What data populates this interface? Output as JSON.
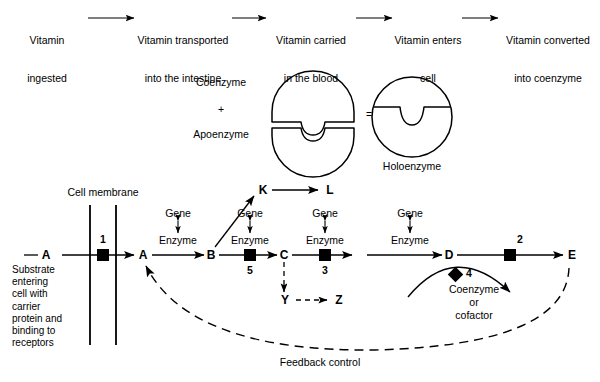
{
  "figure": {
    "background": "#ffffff",
    "ink": "#000000"
  },
  "top_flow": {
    "steps": [
      {
        "line1": "Vitamin",
        "line2": "ingested"
      },
      {
        "line1": "Vitamin transported",
        "line2": "into the intestine"
      },
      {
        "line1": "Vitamin carried",
        "line2": "in the blood"
      },
      {
        "line1": "Vitamin enters",
        "line2": "cell"
      },
      {
        "line1": "Vitamin converted",
        "line2": "into coenzyme"
      }
    ],
    "connector": "arrow-right"
  },
  "enzyme_equation": {
    "left_terms": [
      "Coenzyme",
      "+",
      "Apoenzyme"
    ],
    "operator": "=",
    "result_label": "Holoenzyme",
    "shapes": {
      "coenzyme": "upper-half-disc-with-notch",
      "apoenzyme": "lower-half-disc-with-notch",
      "holoenzyme": "full-disc-with-notch"
    }
  },
  "pathway": {
    "membrane_label": "Cell membrane",
    "substrate_caption": "Substrate\nentering\ncell with\ncarrier\nprotein and\nbinding to\nreceptors",
    "nodes": [
      {
        "id": "A_out",
        "label": "A"
      },
      {
        "id": "A_in",
        "label": "A"
      },
      {
        "id": "B",
        "label": "B"
      },
      {
        "id": "C",
        "label": "C"
      },
      {
        "id": "D",
        "label": "D"
      },
      {
        "id": "E",
        "label": "E"
      }
    ],
    "branch_nodes": [
      {
        "id": "K",
        "label": "K"
      },
      {
        "id": "L",
        "label": "L"
      },
      {
        "id": "Y",
        "label": "Y"
      },
      {
        "id": "Z",
        "label": "Z"
      }
    ],
    "gene_enzyme_pairs": [
      {
        "gene": "Gene",
        "enzyme": "Enzyme"
      },
      {
        "gene": "Gene",
        "enzyme": "Enzyme"
      },
      {
        "gene": "Gene",
        "enzyme": "Enzyme"
      },
      {
        "gene": "Gene",
        "enzyme": "Enzyme"
      }
    ],
    "block_markers": [
      {
        "number": "1",
        "shape": "square"
      },
      {
        "number": "5",
        "shape": "square"
      },
      {
        "number": "3",
        "shape": "square"
      },
      {
        "number": "2",
        "shape": "square"
      },
      {
        "number": "4",
        "shape": "diamond"
      }
    ],
    "cofactor_label": "Coenzyme\nor\ncofactor",
    "feedback_label": "Feedback control"
  }
}
